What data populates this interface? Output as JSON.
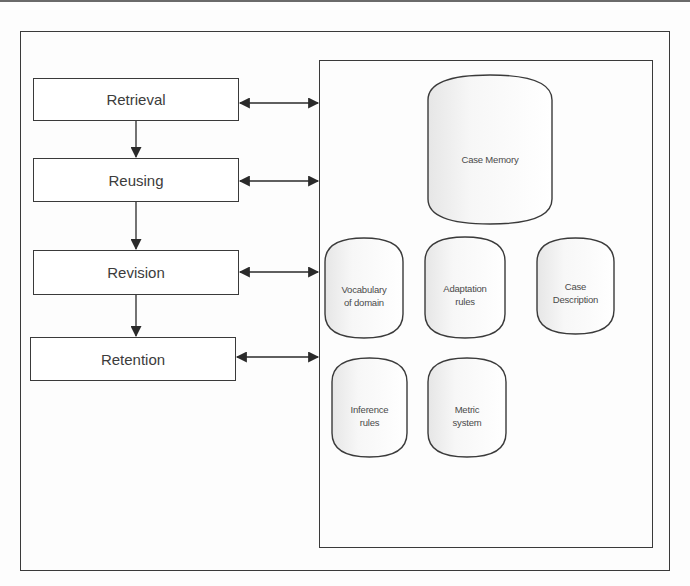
{
  "diagram": {
    "process_steps": [
      {
        "label": "Retrieval"
      },
      {
        "label": "Reusing"
      },
      {
        "label": "Revision"
      },
      {
        "label": "Retention"
      }
    ],
    "knowledge_stores": [
      {
        "label": "Case Memory"
      },
      {
        "label": "Vocabulary\nof domain"
      },
      {
        "label": "Adaptation\nrules"
      },
      {
        "label": "Case\nDescription"
      },
      {
        "label": "Inference\nrules"
      },
      {
        "label": "Metric\nsystem"
      }
    ],
    "colors": {
      "stroke": "#3a3a3a",
      "text": "#3c3c3c",
      "cylinder_fill": "#ffffff",
      "cylinder_shade": "#ececec"
    }
  }
}
